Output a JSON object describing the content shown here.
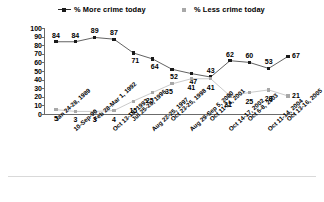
{
  "legend": {
    "items": [
      {
        "label": "% More crime today",
        "marker": "square-marker-dark",
        "color": "#1a1a1a"
      },
      {
        "label": "% Less crime today",
        "marker": "square-marker-light",
        "color": "#a8a8a8"
      }
    ]
  },
  "chart_data": {
    "type": "line",
    "title": "",
    "xlabel": "",
    "ylabel": "",
    "ylim": [
      0,
      100
    ],
    "yticks": [
      100,
      90,
      80,
      70,
      60,
      50,
      40,
      30,
      20,
      10,
      0
    ],
    "grid": false,
    "legend_position": "top",
    "categories": [
      "Jan 24-28, 1989",
      "10-Sep-90",
      "Feb 28-Mar 1, 1992",
      "Oct 13-18, 1993",
      "Jul 25-28, 1996",
      "Aug 22-25, 1997",
      "Oct 23-25, 1998",
      "Aug 29-Sep 5, 2000",
      "Oct 11-14, 2001",
      "Oct 14-17, 2002",
      "Oct 6-8, 2003",
      "Oct 11-14, 2004",
      "Oct 13-16, 2005"
    ],
    "series": [
      {
        "name": "% More crime today",
        "color": "#1a1a1a",
        "values": [
          84,
          84,
          89,
          87,
          71,
          64,
          52,
          47,
          43,
          62,
          60,
          53,
          67
        ]
      },
      {
        "name": "% Less crime today",
        "color": "#a8a8a8",
        "values": [
          5,
          3,
          3,
          4,
          15,
          25,
          35,
          41,
          41,
          21,
          25,
          28,
          21
        ]
      }
    ]
  }
}
